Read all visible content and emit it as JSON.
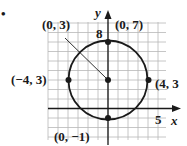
{
  "figure": {
    "bullet": "•",
    "axes": {
      "x_label": "x",
      "y_label": "y",
      "x_tick": "5",
      "y_tick": "8"
    },
    "circle": {
      "center": [
        0,
        3
      ],
      "radius": 4
    },
    "points": [
      {
        "name": "center",
        "label": "(0, 3)",
        "x": 0,
        "y": 3
      },
      {
        "name": "top",
        "label": "(0, 7)",
        "x": 0,
        "y": 7
      },
      {
        "name": "left",
        "label": "(−4, 3)",
        "x": -4,
        "y": 3
      },
      {
        "name": "right",
        "label": "(4, 3",
        "x": 4,
        "y": 3
      },
      {
        "name": "bottom",
        "label": "(0, −1)",
        "x": 0,
        "y": -1
      }
    ],
    "colors": {
      "ink": "#1a1a1a",
      "grid": "#b8b8b8"
    }
  }
}
